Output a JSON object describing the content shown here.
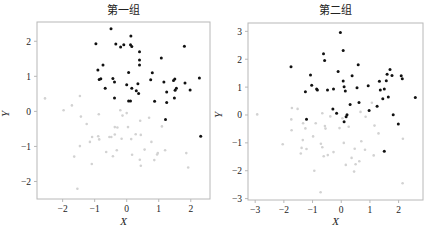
{
  "colors": {
    "dark_point": "#111111",
    "light_point": "#d2d2d2",
    "frame": "#b8b8b8",
    "text": "#222222"
  },
  "chart_data": [
    {
      "type": "scatter",
      "title": "第一组",
      "xlabel": "X",
      "ylabel": "Y",
      "xlim": [
        -2.8,
        2.6
      ],
      "ylim": [
        -2.5,
        2.55
      ],
      "xticks": [
        -2,
        -1,
        0,
        1,
        2
      ],
      "yticks": [
        -2,
        -1,
        0,
        1,
        2
      ],
      "grid": false,
      "legend": null,
      "series": [
        {
          "name": "dark",
          "color": "#111111",
          "points": [
            [
              -0.49,
              2.36
            ],
            [
              -0.96,
              1.93
            ],
            [
              0.13,
              2.15
            ],
            [
              -0.34,
              1.92
            ],
            [
              -0.09,
              1.9
            ],
            [
              -0.19,
              1.84
            ],
            [
              0.12,
              1.9
            ],
            [
              0.16,
              1.85
            ],
            [
              1.8,
              1.86
            ],
            [
              0.4,
              1.7
            ],
            [
              0.4,
              1.47
            ],
            [
              1.08,
              1.52
            ],
            [
              -0.74,
              1.32
            ],
            [
              0.4,
              1.32
            ],
            [
              -0.9,
              1.18
            ],
            [
              0.06,
              1.11
            ],
            [
              0.8,
              1.1
            ],
            [
              -0.81,
              0.93
            ],
            [
              -0.86,
              0.91
            ],
            [
              -0.43,
              0.94
            ],
            [
              -0.38,
              0.84
            ],
            [
              0.75,
              0.9
            ],
            [
              1.16,
              0.84
            ],
            [
              1.5,
              0.92
            ],
            [
              1.46,
              0.88
            ],
            [
              0.0,
              0.76
            ],
            [
              0.35,
              0.79
            ],
            [
              1.82,
              0.81
            ],
            [
              2.27,
              0.95
            ],
            [
              -0.67,
              0.66
            ],
            [
              0.16,
              0.66
            ],
            [
              0.3,
              0.59
            ],
            [
              0.37,
              0.51
            ],
            [
              1.55,
              0.66
            ],
            [
              1.51,
              0.6
            ],
            [
              1.98,
              0.61
            ],
            [
              1.25,
              0.55
            ],
            [
              -0.38,
              0.38
            ],
            [
              1.49,
              0.38
            ],
            [
              0.06,
              0.3
            ],
            [
              0.12,
              0.3
            ],
            [
              0.87,
              0.29
            ],
            [
              1.25,
              0.25
            ],
            [
              1.21,
              -0.23
            ],
            [
              2.31,
              -0.71
            ]
          ]
        },
        {
          "name": "light",
          "color": "#d2d2d2",
          "points": [
            [
              -2.55,
              0.37
            ],
            [
              -1.97,
              0.03
            ],
            [
              -1.71,
              0.17
            ],
            [
              -1.46,
              0.44
            ],
            [
              -1.43,
              -0.15
            ],
            [
              -1.25,
              -0.36
            ],
            [
              -0.87,
              -0.08
            ],
            [
              -0.2,
              0.03
            ],
            [
              0.0,
              -0.05
            ],
            [
              -0.13,
              -0.12
            ],
            [
              -0.37,
              -0.45
            ],
            [
              -0.29,
              -0.46
            ],
            [
              0.04,
              -0.45
            ],
            [
              0.42,
              -0.27
            ],
            [
              0.7,
              -0.18
            ],
            [
              1.1,
              -0.43
            ],
            [
              -0.89,
              -0.71
            ],
            [
              -0.86,
              -0.8
            ],
            [
              -1.08,
              -0.73
            ],
            [
              -1.15,
              -0.87
            ],
            [
              -0.54,
              -0.73
            ],
            [
              -0.48,
              -0.73
            ],
            [
              -0.37,
              -0.66
            ],
            [
              -0.16,
              -0.78
            ],
            [
              0.14,
              -0.79
            ],
            [
              0.44,
              -0.67
            ],
            [
              0.77,
              -0.87
            ],
            [
              -1.46,
              -0.99
            ],
            [
              -0.64,
              -1.16
            ],
            [
              -0.31,
              -1.11
            ],
            [
              0.17,
              -1.24
            ],
            [
              0.56,
              -1.09
            ],
            [
              0.97,
              -1.19
            ],
            [
              1.2,
              -1.11
            ],
            [
              -1.64,
              -1.29
            ],
            [
              -0.43,
              -1.28
            ],
            [
              0.41,
              -1.38
            ],
            [
              0.86,
              -1.39
            ],
            [
              0.95,
              -1.23
            ],
            [
              1.86,
              -1.19
            ],
            [
              -1.09,
              -1.5
            ],
            [
              0.44,
              -1.55
            ],
            [
              1.92,
              -1.6
            ],
            [
              -1.54,
              -2.21
            ],
            [
              0.28,
              -0.65
            ]
          ]
        }
      ]
    },
    {
      "type": "scatter",
      "title": "第二组",
      "xlabel": "X",
      "ylabel": "Y",
      "xlim": [
        -3.25,
        2.85
      ],
      "ylim": [
        -3.05,
        3.3
      ],
      "xticks": [
        -3,
        -2,
        -1,
        0,
        1,
        2
      ],
      "yticks": [
        -3,
        -2,
        -1,
        0,
        1,
        2,
        3
      ],
      "grid": false,
      "legend": null,
      "series": [
        {
          "name": "dark",
          "color": "#111111",
          "points": [
            [
              -0.03,
              2.96
            ],
            [
              0.07,
              2.31
            ],
            [
              -0.62,
              2.2
            ],
            [
              -0.58,
              1.95
            ],
            [
              -1.75,
              1.73
            ],
            [
              0.59,
              1.8
            ],
            [
              1.7,
              1.63
            ],
            [
              -0.11,
              1.56
            ],
            [
              -1.07,
              1.43
            ],
            [
              0.38,
              1.41
            ],
            [
              1.6,
              1.46
            ],
            [
              1.77,
              1.42
            ],
            [
              0.07,
              1.22
            ],
            [
              1.33,
              1.21
            ],
            [
              1.57,
              1.23
            ],
            [
              2.13,
              1.3
            ],
            [
              2.09,
              1.41
            ],
            [
              -1.03,
              1.07
            ],
            [
              0.94,
              1.05
            ],
            [
              0.1,
              1.01
            ],
            [
              0.55,
              0.98
            ],
            [
              -0.86,
              0.93
            ],
            [
              -0.83,
              0.9
            ],
            [
              -0.48,
              0.9
            ],
            [
              -0.27,
              0.93
            ],
            [
              1.36,
              0.9
            ],
            [
              1.5,
              0.93
            ],
            [
              -1.25,
              0.83
            ],
            [
              0.14,
              0.86
            ],
            [
              1.45,
              0.58
            ],
            [
              1.64,
              0.65
            ],
            [
              2.58,
              0.63
            ],
            [
              0.62,
              0.45
            ],
            [
              0.31,
              0.38
            ],
            [
              1.25,
              0.31
            ],
            [
              0.97,
              0.16
            ],
            [
              -0.29,
              0.21
            ],
            [
              -0.16,
              0.06
            ],
            [
              0.2,
              0.01
            ],
            [
              0.17,
              -0.06
            ],
            [
              1.81,
              0.01
            ],
            [
              -1.21,
              -0.15
            ],
            [
              0.1,
              -0.24
            ],
            [
              1.99,
              -0.32
            ],
            [
              1.5,
              -1.3
            ]
          ]
        },
        {
          "name": "light",
          "color": "#d2d2d2",
          "points": [
            [
              -2.93,
              0.02
            ],
            [
              -1.72,
              0.25
            ],
            [
              -1.52,
              0.22
            ],
            [
              -1.74,
              -0.16
            ],
            [
              -1.73,
              -0.55
            ],
            [
              -1.33,
              -0.3
            ],
            [
              -1.25,
              -0.48
            ],
            [
              -0.89,
              -0.3
            ],
            [
              -0.66,
              0.06
            ],
            [
              -0.57,
              -0.4
            ],
            [
              -0.55,
              -0.49
            ],
            [
              -0.38,
              -0.05
            ],
            [
              -0.06,
              -0.47
            ],
            [
              0.04,
              -0.12
            ],
            [
              0.26,
              -0.42
            ],
            [
              0.67,
              0.11
            ],
            [
              0.85,
              -0.06
            ],
            [
              1.16,
              -0.38
            ],
            [
              1.07,
              0.44
            ],
            [
              1.3,
              -0.66
            ],
            [
              -1.34,
              -0.9
            ],
            [
              -1.38,
              -1.18
            ],
            [
              -1.21,
              -1.22
            ],
            [
              -0.98,
              -0.77
            ],
            [
              -0.71,
              -1.03
            ],
            [
              -0.66,
              -1.16
            ],
            [
              -0.47,
              -1.44
            ],
            [
              -0.61,
              -1.48
            ],
            [
              -0.27,
              -1.33
            ],
            [
              0.09,
              -1.0
            ],
            [
              0.47,
              -1.21
            ],
            [
              0.36,
              -1.54
            ],
            [
              0.7,
              -0.94
            ],
            [
              0.83,
              -1.25
            ],
            [
              1.13,
              -1.45
            ],
            [
              -2.04,
              -1.05
            ],
            [
              -1.41,
              -1.38
            ],
            [
              -0.94,
              -2.0
            ],
            [
              0.16,
              -1.79
            ],
            [
              0.5,
              -1.77
            ],
            [
              0.45,
              -2.03
            ],
            [
              0.63,
              -1.66
            ],
            [
              -0.72,
              -2.77
            ],
            [
              2.15,
              -0.85
            ],
            [
              2.14,
              -2.45
            ]
          ]
        }
      ]
    }
  ]
}
